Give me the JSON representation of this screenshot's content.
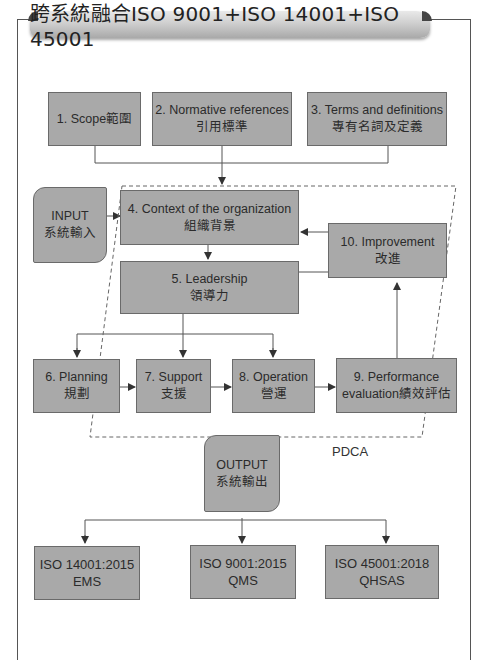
{
  "title": "跨系統融合ISO 9001+ISO 14001+ISO 45001",
  "top_boxes": [
    {
      "en": "1. Scope範圍",
      "zh": ""
    },
    {
      "en": "2. Normative references",
      "zh": "引用標準"
    },
    {
      "en": "3. Terms and definitions",
      "zh": "專有名詞及定義"
    }
  ],
  "input_box": {
    "en": "INPUT",
    "zh": "系統輸入"
  },
  "output_box": {
    "en": "OUTPUT",
    "zh": "系統輸出"
  },
  "clauses": {
    "context": {
      "en": "4. Context of the organization",
      "zh": "組織背景"
    },
    "leadership": {
      "en": "5. Leadership",
      "zh": "領導力"
    },
    "planning": {
      "en": "6. Planning",
      "zh": "規劃"
    },
    "support": {
      "en": "7. Support",
      "zh": "支援"
    },
    "operation": {
      "en": "8. Operation",
      "zh": "營運"
    },
    "performance": {
      "en": "9. Performance",
      "zh": "evaluation績效評估"
    },
    "improvement": {
      "en": "10. Improvement",
      "zh": "改進"
    }
  },
  "cycle_label": "PDCA",
  "standards": [
    {
      "code": "ISO 14001:2015",
      "type": "EMS"
    },
    {
      "code": "ISO 9001:2015",
      "type": "QMS"
    },
    {
      "code": "ISO 45001:2018",
      "type": "QHSAS"
    }
  ],
  "colors": {
    "box_fill": "#a9a9a9",
    "box_border": "#6a6a6a",
    "line": "#555555"
  }
}
